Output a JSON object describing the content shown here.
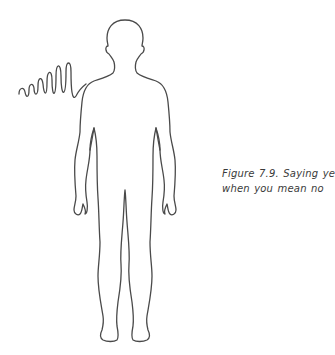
{
  "figure": {
    "caption_line1": "Figure 7.9. Saying yes",
    "caption_line2": "when you mean no",
    "stroke_color": "#4a4a4a",
    "background": "#ffffff"
  },
  "illustration": {
    "subject": "human-body-outline-front-view",
    "annotation": "squiggle-line-near-shoulder"
  }
}
